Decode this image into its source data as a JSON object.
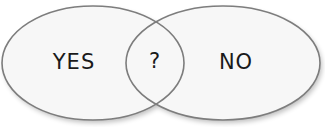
{
  "diagram": {
    "type": "venn",
    "sets": [
      {
        "id": "left",
        "label": "YES"
      },
      {
        "id": "right",
        "label": "NO"
      }
    ],
    "intersection": {
      "label": "?"
    },
    "colors": {
      "background": "#ffffff",
      "fill": "#f7f7f7",
      "stroke": "#7d7d7d",
      "text": "#1a1a1a"
    }
  }
}
